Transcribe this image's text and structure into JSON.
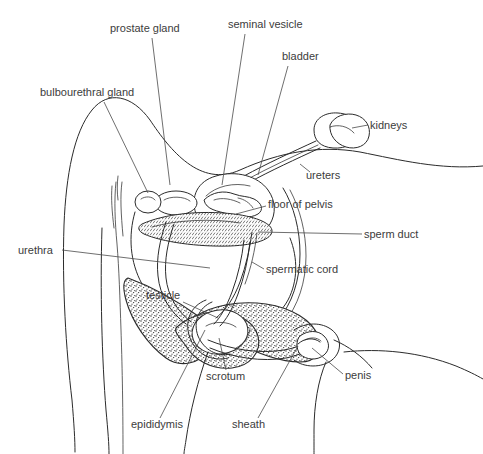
{
  "figure": {
    "background_color": "#ffffff",
    "line_color": "#2b2b2b",
    "label_color": "#3c3c3c",
    "width": 483,
    "height": 454
  },
  "labels": [
    {
      "id": "prostate_gland",
      "text": "prostate gland",
      "x": 110,
      "y": 32,
      "anchor": "start",
      "leader": "M152,38 L170,185"
    },
    {
      "id": "seminal_vesicle",
      "text": "seminal vesicle",
      "x": 228,
      "y": 28,
      "anchor": "start",
      "leader": "M245,34 L222,185"
    },
    {
      "id": "bladder",
      "text": "bladder",
      "x": 282,
      "y": 60,
      "anchor": "start",
      "leader": "M288,66 L258,175"
    },
    {
      "id": "bulbourethral_gland",
      "text": "bulbourethral gland",
      "x": 40,
      "y": 96,
      "anchor": "start",
      "leader": "M104,102 L148,193"
    },
    {
      "id": "kidneys",
      "text": "kidneys",
      "x": 370,
      "y": 129,
      "anchor": "start",
      "leader": "M368,125 L352,128"
    },
    {
      "id": "ureters",
      "text": "ureters",
      "x": 306,
      "y": 179,
      "anchor": "start",
      "leader": "M310,172 L300,164"
    },
    {
      "id": "floor_of_pelvis",
      "text": "floor of pelvis",
      "x": 268,
      "y": 208,
      "anchor": "start",
      "leader": "M266,206 L236,214"
    },
    {
      "id": "sperm_duct",
      "text": "sperm duct",
      "x": 364,
      "y": 238,
      "anchor": "start",
      "leader": "M362,234 L258,232"
    },
    {
      "id": "urethra",
      "text": "urethra",
      "x": 18,
      "y": 254,
      "anchor": "start",
      "leader": "M62,250 L210,268"
    },
    {
      "id": "spermatic_cord",
      "text": "spermatic cord",
      "x": 266,
      "y": 273,
      "anchor": "start",
      "leader": "M264,269 L252,262"
    },
    {
      "id": "testicle",
      "text": "testicle",
      "x": 146,
      "y": 299,
      "anchor": "start",
      "leader": "M183,302 L218,318"
    },
    {
      "id": "scrotum",
      "text": "scrotum",
      "x": 206,
      "y": 380,
      "anchor": "start",
      "leader": "M226,370 L219,338"
    },
    {
      "id": "penis",
      "text": "penis",
      "x": 345,
      "y": 379,
      "anchor": "start",
      "leader": "M343,374 L312,348"
    },
    {
      "id": "epididymis",
      "text": "epididymis",
      "x": 131,
      "y": 428,
      "anchor": "start",
      "leader": "M160,418 L205,330"
    },
    {
      "id": "sheath",
      "text": "sheath",
      "x": 232,
      "y": 428,
      "anchor": "start",
      "leader": "M258,418 L298,346"
    }
  ],
  "structures": [
    {
      "id": "body-outline",
      "name": "body outline"
    },
    {
      "id": "spine-line",
      "name": "vertebral line"
    },
    {
      "id": "bladder-shape",
      "name": "bladder"
    },
    {
      "id": "prostate-shape",
      "name": "prostate gland"
    },
    {
      "id": "seminal-vesicle-shape",
      "name": "seminal vesicle"
    },
    {
      "id": "bulbourethral-shape",
      "name": "bulbourethral gland"
    },
    {
      "id": "kidney-shape",
      "name": "kidneys"
    },
    {
      "id": "ureter-tubes",
      "name": "ureters"
    },
    {
      "id": "pelvis-floor",
      "name": "floor of pelvis"
    },
    {
      "id": "sperm-duct-path",
      "name": "sperm duct"
    },
    {
      "id": "urethra-path",
      "name": "urethra"
    },
    {
      "id": "spermatic-cord-path",
      "name": "spermatic cord"
    },
    {
      "id": "scrotum-shape",
      "name": "scrotum"
    },
    {
      "id": "testicle-shape",
      "name": "testicle"
    },
    {
      "id": "epididymis-shape",
      "name": "epididymis"
    },
    {
      "id": "penis-shape",
      "name": "penis"
    },
    {
      "id": "sheath-shape",
      "name": "sheath"
    }
  ]
}
